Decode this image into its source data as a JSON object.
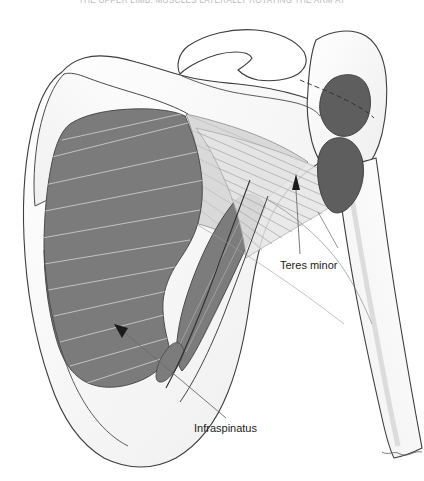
{
  "header": {
    "running_title": "THE UPPER LIMB: MUSCLES LATERALLY ROTATING THE ARM AT"
  },
  "figure": {
    "labels": [
      {
        "id": "teres-minor",
        "text": "Teres minor"
      },
      {
        "id": "infraspinatus",
        "text": "Infraspinatus"
      }
    ],
    "colors": {
      "background": "#ffffff",
      "bone_fill": "#ffffff",
      "bone_shadow": "#f2f2f2",
      "bone_outline": "#3d3d3d",
      "muscle_dark": "#7c7c7c",
      "muscle_light": "#d9d9d9",
      "muscle_fiber": "#c9c9c9",
      "tendon_fiber": "#b0b0b0",
      "insertion_dark": "#5e5e5e",
      "leader_line": "#6b6b6b",
      "label_text": "#1b1b1b",
      "header_text": "#b9b9b9"
    }
  }
}
